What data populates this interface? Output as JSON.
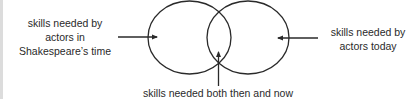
{
  "diagram": {
    "type": "venn",
    "sets": [
      {
        "id": "left",
        "label_lines": [
          "skills needed by",
          "actors in",
          "Shakespeare’s time"
        ]
      },
      {
        "id": "right",
        "label_lines": [
          "skills needed by",
          "actors today"
        ]
      }
    ],
    "intersection": {
      "label": "skills needed both then and now"
    },
    "colors": {
      "stroke": "#2a2a2a",
      "text": "#2a2a2a",
      "background": "#ffffff",
      "edge_strip": "#dcdcdc"
    }
  }
}
